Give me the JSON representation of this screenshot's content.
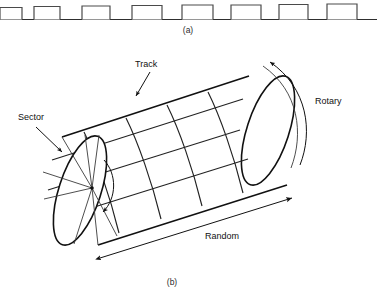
{
  "figure": {
    "panels": [
      {
        "id": "a",
        "caption": "(a)",
        "kind": "tape-track",
        "description": "linear tape with sequential blocks",
        "block_count": 8
      },
      {
        "id": "b",
        "caption": "(b)",
        "kind": "drum-cylinder",
        "description": "rotating drum with tracks and sectors"
      }
    ],
    "labels": {
      "track": "Track",
      "sector": "Sector",
      "rotary": "Rotary",
      "random": "Random"
    },
    "colors": {
      "ink": "#1a1a1a",
      "ink_light": "#3a3a3a",
      "background": "#ffffff"
    },
    "tape": {
      "blocks": [
        {
          "x": 0,
          "width": 22
        },
        {
          "x": 34,
          "width": 26
        },
        {
          "x": 82,
          "width": 28
        },
        {
          "x": 132,
          "width": 30
        },
        {
          "x": 182,
          "width": 31
        },
        {
          "x": 231,
          "width": 30
        },
        {
          "x": 279,
          "width": 29
        },
        {
          "x": 327,
          "width": 30
        }
      ],
      "baseline_y": 19,
      "block_height": 12,
      "line_start_x": 0,
      "line_end_x": 377
    },
    "cylinder": {
      "track_bands": 5,
      "sector_spokes": 8,
      "axis_from": [
        98,
        188
      ],
      "axis_to": [
        278,
        130
      ]
    }
  }
}
